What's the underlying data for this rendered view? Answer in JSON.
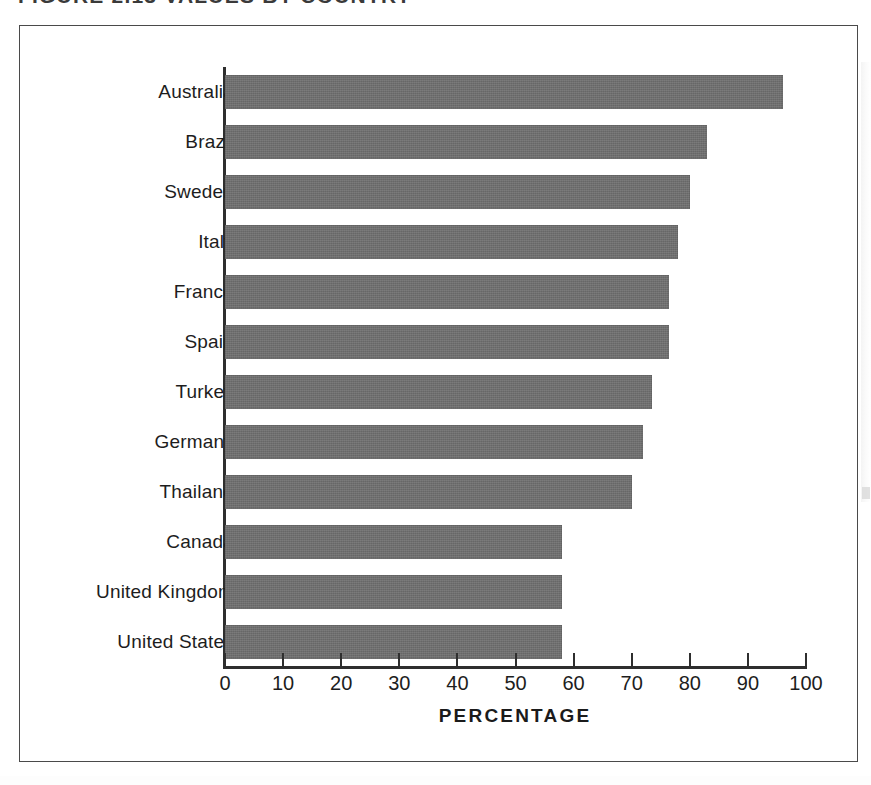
{
  "figure": {
    "caption_clipped": "FIGURE 2.13   VALUES BY COUNTRY",
    "background_color": "#ffffff",
    "frame_color": "#4a4a4a"
  },
  "chart_data": {
    "type": "bar",
    "orientation": "horizontal",
    "title": "",
    "xlabel": "PERCENTAGE",
    "ylabel": "",
    "xlim": [
      0,
      100
    ],
    "grid": false,
    "legend": null,
    "bar_color": "#6f6f6f",
    "axis_color": "#2e2e2e",
    "xticks": [
      0,
      10,
      20,
      30,
      40,
      50,
      60,
      70,
      80,
      90,
      100
    ],
    "xticklabels": [
      "0",
      "10",
      "20",
      "30",
      "40",
      "50",
      "60",
      "70",
      "80",
      "90",
      "100"
    ],
    "categories": [
      "Australia",
      "Brazil",
      "Sweden",
      "Italy",
      "France",
      "Spain",
      "Turkey",
      "Germany",
      "Thailand",
      "Canada",
      "United Kingdom",
      "United States"
    ],
    "values": [
      96,
      83,
      80,
      78,
      76.5,
      76.5,
      73.5,
      72,
      70,
      58,
      58,
      58
    ],
    "series": [
      {
        "name": "Percentage",
        "values": [
          96,
          83,
          80,
          78,
          76.5,
          76.5,
          73.5,
          72,
          70,
          58,
          58,
          58
        ]
      }
    ]
  }
}
